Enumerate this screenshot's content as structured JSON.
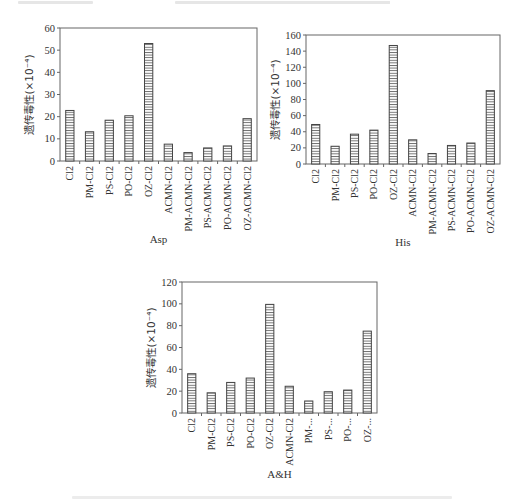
{
  "chart_data": [
    {
      "type": "bar",
      "title": "Asp",
      "xlabel": "Asp",
      "ylabel": "遗传毒性(×10⁻⁴)",
      "ylim": [
        0,
        60
      ],
      "yticks": [
        0,
        10,
        20,
        30,
        40,
        50,
        60
      ],
      "grid": false,
      "legend": "none",
      "categories": [
        "Cl2",
        "PM-Cl2",
        "PS-Cl2",
        "PO-Cl2",
        "OZ-Cl2",
        "ACMN-Cl2",
        "PM-ACMN-Cl2",
        "PS-ACMN-Cl2",
        "PO-ACMN-Cl2",
        "OZ-ACMN-Cl2"
      ],
      "values": [
        22.8,
        13.2,
        18.4,
        20.4,
        53,
        7.6,
        3.8,
        5.9,
        6.8,
        19.1
      ]
    },
    {
      "type": "bar",
      "title": "His",
      "xlabel": "His",
      "ylabel": "遗传毒性(×10⁻⁴)",
      "ylim": [
        0,
        160
      ],
      "yticks": [
        0,
        20,
        40,
        60,
        80,
        100,
        120,
        140,
        160
      ],
      "grid": false,
      "legend": "none",
      "categories": [
        "Cl2",
        "PM-Cl2",
        "PS-Cl2",
        "PO-Cl2",
        "OZ-Cl2",
        "ACMN-Cl2",
        "PM-ACMN-Cl2",
        "PS-ACMN-Cl2",
        "PO-ACMN-Cl2",
        "OZ-ACMN-Cl2"
      ],
      "values": [
        49,
        22,
        37,
        42,
        147,
        30,
        13,
        23,
        26,
        91
      ]
    },
    {
      "type": "bar",
      "title": "A&H",
      "xlabel": "A&H",
      "ylabel": "遗传毒性(×10⁻⁴)",
      "ylim": [
        0,
        120
      ],
      "yticks": [
        0,
        20,
        40,
        60,
        80,
        100,
        120
      ],
      "grid": false,
      "legend": "none",
      "categories": [
        "Cl2",
        "PM-Cl2",
        "PS-Cl2",
        "PO-Cl2",
        "OZ-Cl2",
        "ACMN-Cl2",
        "PM-...",
        "PS-...",
        "PO-...",
        "OZ-..."
      ],
      "values": [
        36,
        18.5,
        28,
        32,
        99.5,
        24.5,
        11,
        19.5,
        21,
        75
      ]
    }
  ],
  "style": {
    "bar_fill": "#ffffff",
    "bar_stroke": "#444444",
    "axis_color": "#666666",
    "text_color": "#333333"
  }
}
